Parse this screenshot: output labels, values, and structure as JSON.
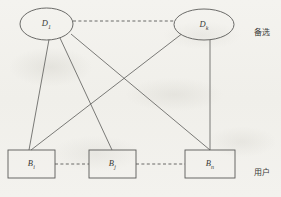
{
  "figure": {
    "type": "bipartite-graph-diagram",
    "background_color": "#f2f1ed",
    "stroke_color": "#5a5a58",
    "text_color": "#3a3a38",
    "width": 281,
    "height": 197
  },
  "layers": {
    "top": {
      "side_label": "备选",
      "side_label_x": 262,
      "side_label_y": 31,
      "nodes": [
        {
          "id": "D1",
          "shape": "ellipse",
          "letter": "D",
          "subscript": "1",
          "cx": 46.5,
          "cy": 24,
          "rx": 26.5,
          "ry": 16
        },
        {
          "id": "Dk",
          "shape": "ellipse",
          "letter": "D",
          "subscript": "k",
          "cx": 204,
          "cy": 24.5,
          "rx": 30,
          "ry": 15.5
        }
      ],
      "ellipsis_connector": {
        "from": "D1",
        "to": "Dk",
        "style": "dashed",
        "x1": 73,
        "y1": 21,
        "x2": 174,
        "y2": 21
      }
    },
    "bottom": {
      "side_label": "用户",
      "side_label_x": 262,
      "side_label_y": 171,
      "nodes": [
        {
          "id": "Bi",
          "shape": "rect",
          "letter": "B",
          "subscript": "i",
          "x": 8,
          "y": 150,
          "w": 47,
          "h": 28
        },
        {
          "id": "Bj",
          "shape": "rect",
          "letter": "B",
          "subscript": "j",
          "x": 89,
          "y": 150,
          "w": 47,
          "h": 28
        },
        {
          "id": "Bn",
          "shape": "rect",
          "letter": "B",
          "subscript": "n",
          "x": 185,
          "y": 150,
          "w": 50,
          "h": 28
        }
      ],
      "ellipsis_connectors": [
        {
          "from": "Bi",
          "to": "Bj",
          "style": "dashed",
          "x1": 55,
          "y1": 164,
          "x2": 89,
          "y2": 164
        },
        {
          "from": "Bj",
          "to": "Bn",
          "style": "dashed",
          "x1": 136,
          "y1": 164,
          "x2": 185,
          "y2": 164
        }
      ]
    }
  },
  "edges": [
    {
      "from": "D1",
      "to": "Bi",
      "style": "solid",
      "x1": 49,
      "y1": 39.5,
      "x2": 29,
      "y2": 150
    },
    {
      "from": "D1",
      "to": "Bj",
      "style": "solid",
      "x1": 60,
      "y1": 38,
      "x2": 112,
      "y2": 150
    },
    {
      "from": "D1",
      "to": "Bn",
      "style": "solid",
      "x1": 71,
      "y1": 34,
      "x2": 210,
      "y2": 150
    },
    {
      "from": "Dk",
      "to": "Bi",
      "style": "solid",
      "x1": 181,
      "y1": 34.5,
      "x2": 31,
      "y2": 150
    },
    {
      "from": "Dk",
      "to": "Bn",
      "style": "solid",
      "x1": 210,
      "y1": 39.5,
      "x2": 210,
      "y2": 150
    }
  ]
}
